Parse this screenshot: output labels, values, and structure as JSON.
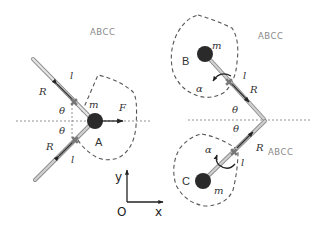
{
  "figure": {
    "background": "#ffffff",
    "colors": {
      "rod_fill": "#c8c8c8",
      "rod_edge": "#8a8a8a",
      "mass": "#2a2a2a",
      "dashed": "#555555",
      "pivot": "#777777",
      "arrow": "#222222"
    },
    "watermarks": [
      "ABCC",
      "ABCC",
      "ABCC"
    ],
    "panel_left": {
      "mass_label": "m",
      "region_label": "A",
      "force_label": "F",
      "upper": {
        "length_label": "l",
        "radius_label": "R",
        "angle_label": "θ"
      },
      "lower": {
        "length_label": "l",
        "radius_label": "R",
        "angle_label": "θ"
      }
    },
    "panel_right": {
      "upper": {
        "region_label": "B",
        "mass_label": "m",
        "length_label": "l",
        "radius_label": "R",
        "angle_label": "θ",
        "rotation_label": "α"
      },
      "lower": {
        "region_label": "C",
        "mass_label": "m",
        "length_label": "l",
        "radius_label": "R",
        "angle_label": "θ",
        "rotation_label": "α"
      }
    },
    "axes": {
      "origin_label": "O",
      "x_label": "x",
      "y_label": "y"
    }
  }
}
